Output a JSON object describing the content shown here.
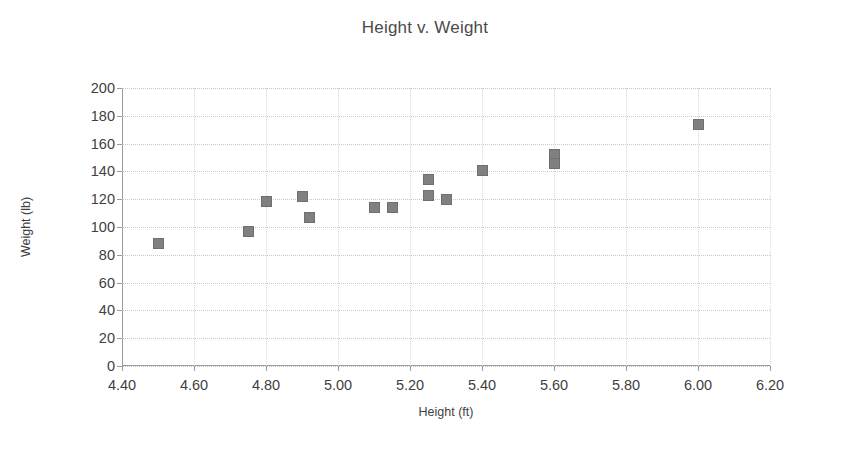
{
  "chart_data": {
    "type": "scatter",
    "title": "Height v. Weight",
    "xlabel": "Height (ft)",
    "ylabel": "Weight (lb)",
    "xlim": [
      4.4,
      6.2
    ],
    "ylim": [
      0,
      200
    ],
    "xticks": [
      "4.40",
      "4.60",
      "4.80",
      "5.00",
      "5.20",
      "5.40",
      "5.60",
      "5.80",
      "6.00",
      "6.20"
    ],
    "xtick_values": [
      4.4,
      4.6,
      4.8,
      5.0,
      5.2,
      5.4,
      5.6,
      5.8,
      6.0,
      6.2
    ],
    "yticks": [
      "0",
      "20",
      "40",
      "60",
      "80",
      "100",
      "120",
      "140",
      "160",
      "180",
      "200"
    ],
    "ytick_values": [
      0,
      20,
      40,
      60,
      80,
      100,
      120,
      140,
      160,
      180,
      200
    ],
    "grid": true,
    "legend": false,
    "marker_color": "#808080",
    "marker_shape": "square",
    "series": [
      {
        "name": "Height v. Weight",
        "points": [
          {
            "x": 4.5,
            "y": 88
          },
          {
            "x": 4.75,
            "y": 97
          },
          {
            "x": 4.8,
            "y": 118
          },
          {
            "x": 4.9,
            "y": 122
          },
          {
            "x": 4.92,
            "y": 107
          },
          {
            "x": 5.1,
            "y": 114
          },
          {
            "x": 5.15,
            "y": 114
          },
          {
            "x": 5.25,
            "y": 134
          },
          {
            "x": 5.25,
            "y": 123
          },
          {
            "x": 5.3,
            "y": 120
          },
          {
            "x": 5.4,
            "y": 141
          },
          {
            "x": 5.6,
            "y": 152
          },
          {
            "x": 5.6,
            "y": 146
          },
          {
            "x": 6.0,
            "y": 174
          }
        ]
      }
    ]
  }
}
